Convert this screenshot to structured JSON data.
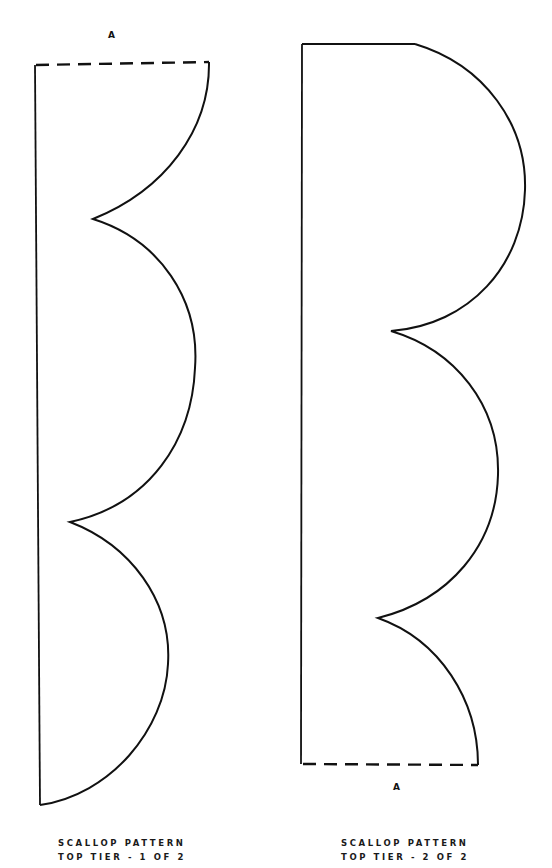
{
  "colors": {
    "stroke": "#111111",
    "background": "#ffffff"
  },
  "pieces": [
    {
      "id": "piece-1",
      "join_label": "A",
      "caption": {
        "line1": "SCALLOP PATTERN",
        "line2": "TOP TIER - 1 OF 2"
      },
      "join_edge": "top (dashed)"
    },
    {
      "id": "piece-2",
      "join_label": "A",
      "caption": {
        "line1": "SCALLOP PATTERN",
        "line2": "TOP TIER - 2 OF 2"
      },
      "join_edge": "bottom (dashed)"
    }
  ]
}
